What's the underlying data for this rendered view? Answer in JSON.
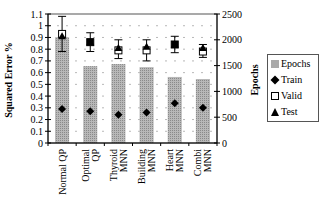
{
  "chart_data": {
    "type": "bar",
    "title": "",
    "xlabel": "",
    "ylabel": "Squared Error %",
    "y2label": "Epochs",
    "ylim": [
      0,
      1.1
    ],
    "y2lim": [
      0,
      2500
    ],
    "yticks": [
      "0",
      "0.1",
      "0.2",
      "0.3",
      "0.4",
      "0.5",
      "0.6",
      "0.7",
      "0.8",
      "0.9",
      "1",
      "1.1"
    ],
    "y2ticks": [
      "0",
      "500",
      "1000",
      "1500",
      "2000",
      "2500"
    ],
    "grid": "dashed horizontal",
    "legend_position": "right",
    "categories": [
      "Normal QP",
      "Optimal QP",
      "Thyroid MNN",
      "Building MNN",
      "Heart MNN",
      "Combi MNN"
    ],
    "category_lines": [
      [
        "Normal QP"
      ],
      [
        "Optimal",
        "QP"
      ],
      [
        "Thyroid",
        "MNN"
      ],
      [
        "Building",
        "MNN"
      ],
      [
        "Heart",
        "MNN"
      ],
      [
        "Combi",
        "MNN"
      ]
    ],
    "series": [
      {
        "name": "Epochs",
        "type": "bar",
        "axis": "right",
        "values": [
          2050,
          1490,
          1530,
          1470,
          1280,
          1240
        ]
      },
      {
        "name": "Train",
        "type": "marker",
        "marker": "diamond",
        "axis": "left",
        "values": [
          0.29,
          0.27,
          0.24,
          0.26,
          0.34,
          0.3
        ]
      },
      {
        "name": "Valid",
        "type": "marker",
        "marker": "square-open",
        "axis": "left",
        "values": [
          0.93,
          0.86,
          0.79,
          0.79,
          0.84,
          0.78
        ],
        "error_low": [
          0.78,
          0.78,
          0.72,
          0.7,
          0.77,
          0.73
        ],
        "error_high": [
          1.08,
          0.94,
          0.88,
          0.88,
          0.91,
          0.84
        ]
      },
      {
        "name": "Test",
        "type": "marker",
        "marker": "triangle",
        "axis": "left",
        "values": [
          0.91,
          0.86,
          0.81,
          0.82,
          0.84,
          0.81
        ]
      }
    ]
  },
  "legend": {
    "items": [
      {
        "label": "Epochs",
        "icon": "hatched-square"
      },
      {
        "label": "Train",
        "icon": "diamond"
      },
      {
        "label": "Valid",
        "icon": "open-square"
      },
      {
        "label": "Test",
        "icon": "triangle"
      }
    ]
  },
  "colors": {
    "bar": "#aaaaaa",
    "marker": "#000000",
    "grid": "#999999",
    "axis": "#000000"
  }
}
